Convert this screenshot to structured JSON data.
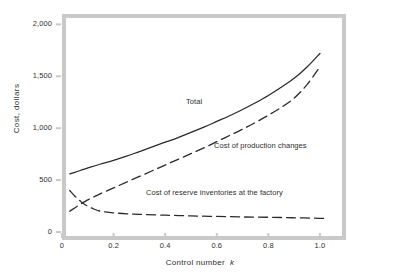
{
  "chart_data": {
    "type": "line",
    "title": "",
    "xlabel": "Control number",
    "xlabel_variable": "k",
    "ylabel": "Cost, dollars",
    "xlim": [
      0,
      1.07
    ],
    "ylim": [
      0,
      2100
    ],
    "xticks": [
      "0",
      "0.2",
      "0.4",
      "0.6",
      "0.8",
      "1.0"
    ],
    "xtick_values": [
      0,
      0.2,
      0.4,
      0.6,
      0.8,
      1.0
    ],
    "yticks": [
      "0",
      "500",
      "1,000",
      "1,500",
      "2,000"
    ],
    "ytick_values": [
      0,
      500,
      1000,
      1500,
      2000
    ],
    "grid": false,
    "legend_position": "inline-annotations",
    "series": [
      {
        "name": "Total",
        "style": "solid",
        "color": "#2b2b2b",
        "x": [
          0.03,
          0.05,
          0.08,
          0.11,
          0.15,
          0.2,
          0.25,
          0.3,
          0.35,
          0.4,
          0.45,
          0.5,
          0.55,
          0.6,
          0.65,
          0.7,
          0.75,
          0.8,
          0.85,
          0.9,
          0.95,
          1.0
        ],
        "y": [
          560,
          575,
          600,
          625,
          655,
          690,
          730,
          775,
          820,
          865,
          910,
          960,
          1010,
          1065,
          1120,
          1180,
          1245,
          1315,
          1395,
          1480,
          1590,
          1720
        ]
      },
      {
        "name": "Cost of production changes",
        "style": "dashed",
        "color": "#2b2b2b",
        "x": [
          0.03,
          0.06,
          0.09,
          0.12,
          0.15,
          0.2,
          0.25,
          0.3,
          0.35,
          0.4,
          0.45,
          0.5,
          0.55,
          0.6,
          0.65,
          0.7,
          0.75,
          0.8,
          0.85,
          0.9,
          0.95,
          1.0
        ],
        "y": [
          200,
          250,
          295,
          335,
          370,
          425,
          480,
          535,
          590,
          645,
          700,
          755,
          810,
          870,
          930,
          990,
          1055,
          1125,
          1200,
          1290,
          1420,
          1590
        ]
      },
      {
        "name": "Cost of reserve inventories at the factory",
        "style": "dashed",
        "color": "#2b2b2b",
        "x": [
          0.03,
          0.05,
          0.07,
          0.09,
          0.12,
          0.15,
          0.2,
          0.25,
          0.3,
          0.4,
          0.5,
          0.6,
          0.7,
          0.8,
          0.9,
          1.0,
          1.03
        ],
        "y": [
          400,
          345,
          300,
          262,
          225,
          200,
          185,
          175,
          170,
          162,
          155,
          150,
          145,
          142,
          137,
          132,
          130
        ]
      }
    ],
    "annotations": [
      {
        "text": "Total",
        "x": 0.45,
        "y": 1090
      },
      {
        "text": "Cost of production changes",
        "x": 0.56,
        "y": 680
      },
      {
        "text": "Cost of reserve inventories at the factory",
        "x": 0.3,
        "y": 240
      }
    ]
  },
  "colors": {
    "frame": "#c9c9c9",
    "curve": "#2b2b2b",
    "text": "#2e2e2e",
    "background": "#ffffff"
  }
}
